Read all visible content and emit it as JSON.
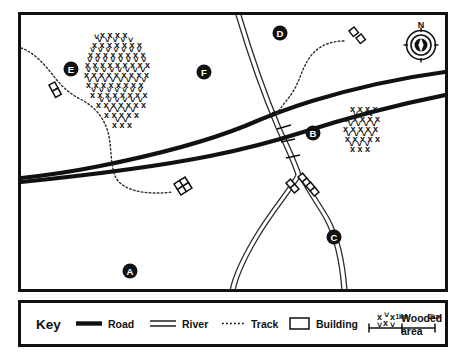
{
  "map": {
    "title": "Ordnance Survey style sketch map",
    "frame": {
      "x": 18,
      "y": 12,
      "width": 430,
      "height": 280
    },
    "compass": {
      "label": "N",
      "cx": 421,
      "cy": 45,
      "r": 15
    },
    "points": [
      {
        "id": "A",
        "label": "A",
        "x": 130,
        "y": 271
      },
      {
        "id": "B",
        "label": "B",
        "x": 313,
        "y": 133
      },
      {
        "id": "C",
        "label": "C",
        "x": 334,
        "y": 237
      },
      {
        "id": "D",
        "label": "D",
        "x": 280,
        "y": 33
      },
      {
        "id": "E",
        "label": "E",
        "x": 71,
        "y": 69
      },
      {
        "id": "F",
        "label": "F",
        "x": 204,
        "y": 72
      }
    ],
    "wooded_areas": [
      {
        "name": "large-wood-northwest",
        "cx": 143,
        "cy": 75,
        "rx": 53,
        "ry": 47
      },
      {
        "name": "small-wood-east",
        "cx": 366,
        "cy": 130,
        "rx": 26,
        "ry": 26
      }
    ],
    "buildings": [
      {
        "name": "building-west-track",
        "x": 49,
        "y": 85,
        "angle": -28,
        "cells": 2
      },
      {
        "name": "building-central",
        "x": 181,
        "y": 191,
        "angle": -32,
        "cells": 4
      },
      {
        "name": "building-cluster-east",
        "x": 300,
        "y": 185,
        "angle": -38,
        "cells": 6
      },
      {
        "name": "building-north",
        "x": 354,
        "y": 38,
        "angle": -36,
        "cells": 2
      }
    ],
    "colors": {
      "ink": "#111111",
      "paper": "#ffffff"
    }
  },
  "key": {
    "frame": {
      "x": 18,
      "y": 300,
      "width": 430,
      "height": 47
    },
    "title": "Key",
    "entries": [
      {
        "id": "road",
        "label": "Road",
        "symbol": "thick-solid-line"
      },
      {
        "id": "river",
        "label": "River",
        "symbol": "double-parallel-line"
      },
      {
        "id": "track",
        "label": "Track",
        "symbol": "dotted-line"
      },
      {
        "id": "building",
        "label": "Building",
        "symbol": "open-rectangle"
      },
      {
        "id": "wooded",
        "label": "Wooded area",
        "label_line1": "Wooded",
        "label_line2": "area",
        "symbol": "x-cluster"
      }
    ],
    "scale": {
      "ticks": [
        "1km",
        "2km"
      ],
      "tick_1": "1km",
      "tick_2": "2km",
      "x": 369,
      "y": 325,
      "length": 66
    }
  }
}
